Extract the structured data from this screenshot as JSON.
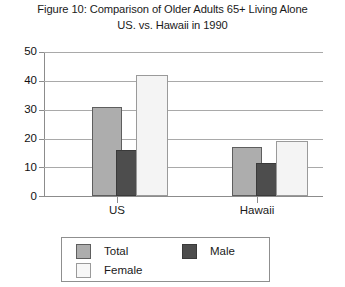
{
  "chart_data": {
    "type": "bar",
    "title": "Figure 10: Comparison of Older Adults 65+ Living Alone",
    "subtitle": "US. vs. Hawaii in 1990",
    "title_lines": [
      "Figure 10: Comparison of Older Adults 65+ Living Alone",
      "US. vs. Hawaii in 1990"
    ],
    "xlabel": "",
    "ylabel": "",
    "categories": [
      "US",
      "Hawaii"
    ],
    "series": [
      {
        "name": "Total",
        "values": [
          31,
          17
        ],
        "color": "#adadad"
      },
      {
        "name": "Male",
        "values": [
          16,
          11.5
        ],
        "color": "#4d4d4d"
      },
      {
        "name": "Female",
        "values": [
          42,
          19
        ],
        "color": "#f4f4f4"
      }
    ],
    "ylim": [
      0,
      50
    ],
    "ytick_values": [
      0,
      10,
      20,
      30,
      40,
      50
    ],
    "ytick_labels": [
      "0",
      "10",
      "20",
      "30",
      "40",
      "50"
    ],
    "grid": "horizontal",
    "legend_position": "bottom",
    "legend_entries": [
      "Total",
      "Male",
      "Female"
    ]
  },
  "axes": {
    "y_labels": [
      "50",
      "40",
      "30",
      "20",
      "10",
      "0"
    ],
    "x_labels": [
      "US",
      "Hawaii"
    ]
  },
  "legend": {
    "items": [
      {
        "label": "Total"
      },
      {
        "label": "Male"
      },
      {
        "label": "Female"
      }
    ]
  }
}
